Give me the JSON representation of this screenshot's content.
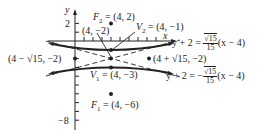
{
  "diagram": {
    "type": "hyperbola",
    "axes": {
      "x_label": "x",
      "y_label": "y",
      "y_tick_labels": [
        "2",
        "−8"
      ]
    },
    "points": {
      "F2": {
        "name": "F",
        "sub": "2",
        "coords": "(4, 2)"
      },
      "V2": {
        "name": "V",
        "sub": "2",
        "coords": "(4, −1)"
      },
      "center": {
        "coords": "(4, −2)"
      },
      "left_point": {
        "coords": "(4 − √15, −2)"
      },
      "right_point": {
        "coords": "(4 + √15, −2)"
      },
      "V1": {
        "name": "V",
        "sub": "1",
        "coords": "(4, −3)"
      },
      "F1": {
        "name": "F",
        "sub": "1",
        "coords": "(4, −6)"
      }
    },
    "asymptotes": {
      "upper": {
        "lhs": "y + 2 = ",
        "sign": "",
        "num": "√15",
        "den": "15",
        "rhs": "(x − 4)"
      },
      "lower": {
        "lhs": "y + 2 = −",
        "sign": "−",
        "num": "√15",
        "den": "15",
        "rhs": "(x − 4)"
      }
    },
    "colors": {
      "ink": "#222222",
      "background": "#ffffff"
    }
  }
}
